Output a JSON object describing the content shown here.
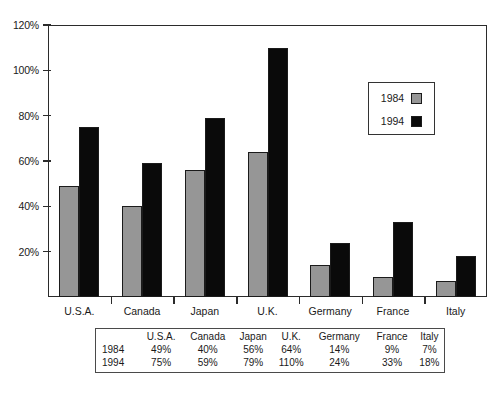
{
  "chart_data": {
    "type": "bar",
    "title": "",
    "subtitle": "",
    "xlabel": "",
    "ylabel": "",
    "categories": [
      "U.S.A.",
      "Canada",
      "Japan",
      "U.K.",
      "Germany",
      "France",
      "Italy"
    ],
    "series": [
      {
        "name": "1984",
        "color": "#969696",
        "values": [
          49,
          40,
          56,
          64,
          14,
          9,
          7
        ]
      },
      {
        "name": "1994",
        "color": "#0a0a0a",
        "values": [
          75,
          59,
          79,
          110,
          24,
          33,
          18
        ]
      }
    ],
    "ylim": [
      0,
      120
    ],
    "yticks": [
      20,
      40,
      60,
      80,
      100,
      120
    ],
    "ytick_labels": [
      "20%",
      "40%",
      "60%",
      "80%",
      "100%",
      "120%"
    ],
    "grid": false,
    "legend_position": "inside-upper-right",
    "value_suffix": "%"
  },
  "legend": {
    "entries": [
      {
        "label": "1984",
        "swatch": "gray-swatch-icon"
      },
      {
        "label": "1994",
        "swatch": "black-swatch-icon"
      }
    ]
  },
  "data_table": {
    "corner_label": "",
    "column_headers": [
      "U.S.A.",
      "Canada",
      "Japan",
      "U.K.",
      "Germany",
      "France",
      "Italy"
    ],
    "rows": [
      {
        "label": "1984",
        "values": [
          "49%",
          "40%",
          "56%",
          "64%",
          "14%",
          "9%",
          "7%"
        ]
      },
      {
        "label": "1994",
        "values": [
          "75%",
          "59%",
          "79%",
          "110%",
          "24%",
          "33%",
          "18%"
        ]
      }
    ]
  },
  "axis": {
    "y_labels": [
      "120%",
      "100%",
      "80%",
      "60%",
      "40%",
      "20%"
    ]
  },
  "colors": {
    "series_1984": "#969696",
    "series_1994": "#0a0a0a",
    "frame": "#2b2b2b",
    "background": "#ffffff"
  }
}
